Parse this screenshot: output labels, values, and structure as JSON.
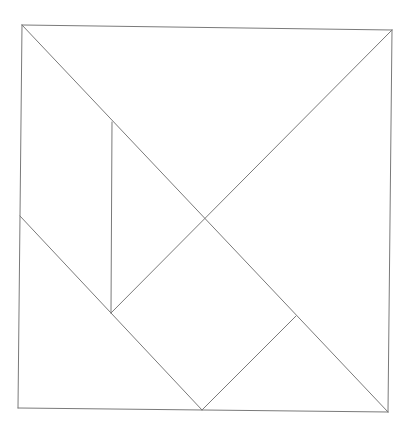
{
  "diagram": {
    "type": "tangram",
    "width": 413,
    "height": 436,
    "stroke_color": "#7a7a7a",
    "background": "#ffffff",
    "points": {
      "TL": [
        22,
        25
      ],
      "TR": [
        392,
        30
      ],
      "BR": [
        388,
        412
      ],
      "BL": [
        18,
        408
      ],
      "C": [
        204,
        219
      ],
      "L": [
        20,
        216
      ],
      "P1": [
        112,
        122
      ],
      "P2": [
        111,
        313
      ],
      "P3": [
        296,
        316
      ],
      "B": [
        202,
        410
      ]
    },
    "pieces": [
      {
        "name": "large-triangle-top",
        "points": [
          "TL",
          "TR",
          "C"
        ]
      },
      {
        "name": "large-triangle-right",
        "points": [
          "TR",
          "BR",
          "C"
        ]
      },
      {
        "name": "parallelogram-left",
        "points": [
          "TL",
          "P1",
          "P2",
          "L"
        ]
      },
      {
        "name": "small-triangle-middle",
        "points": [
          "P1",
          "C",
          "P2"
        ]
      },
      {
        "name": "square",
        "points": [
          "C",
          "P3",
          "B",
          "P2"
        ]
      },
      {
        "name": "small-triangle-bottom-right",
        "points": [
          "P3",
          "BR",
          "B"
        ]
      },
      {
        "name": "medium-triangle-bottom-left",
        "points": [
          "L",
          "P2",
          "B",
          "BL"
        ]
      }
    ],
    "lines": [
      {
        "name": "outer-top-edge",
        "from": "TL",
        "to": "TR"
      },
      {
        "name": "outer-right-edge",
        "from": "TR",
        "to": "BR"
      },
      {
        "name": "outer-bottom-edge",
        "from": "BR",
        "to": "BL"
      },
      {
        "name": "outer-left-edge",
        "from": "BL",
        "to": "TL"
      },
      {
        "name": "main-diagonal",
        "from": "TL",
        "to": "BR"
      },
      {
        "name": "anti-diagonal-upper",
        "from": "TR",
        "to": "P2"
      },
      {
        "name": "vertical-inner-line",
        "from": "P1",
        "to": "P2"
      },
      {
        "name": "left-diagonal",
        "from": "L",
        "to": "B"
      },
      {
        "name": "square-right-edge",
        "from": "P3",
        "to": "B"
      }
    ]
  }
}
